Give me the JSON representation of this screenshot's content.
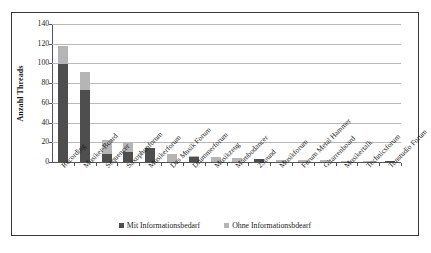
{
  "chart_data": {
    "type": "bar",
    "subtype": "stacked-bar",
    "title": "",
    "xlabel": "",
    "ylabel": "Anzahl Threads",
    "ylim": [
      0,
      140
    ],
    "ytick_values": [
      0,
      20,
      40,
      60,
      80,
      100,
      120,
      140
    ],
    "ytick_labels": [
      "0",
      "20",
      "40",
      "60",
      "80",
      "100",
      "120",
      "140"
    ],
    "grid": true,
    "legend_position": "bottom",
    "categories": [
      "Recording",
      "Musiker-Board",
      "Sequencer",
      "Saxophonforum",
      "Musikerforum",
      "Das Musik Forum",
      "Drummerforum",
      "Musikzeug",
      "Mambodancer",
      "2Sound",
      "Musikforum",
      "Forum Metal Hammer",
      "Gitarrenboard",
      "Musikertalk",
      "Technicsforum",
      "Tonstudio Forum"
    ],
    "series": [
      {
        "name": "Mit Informationsbedarf",
        "color": "#4e4e4e",
        "values": [
          99,
          73,
          8,
          10,
          14,
          0,
          5,
          0,
          0,
          3,
          0,
          0,
          0,
          0,
          0,
          1
        ]
      },
      {
        "name": "Ohne Informationsbdearf",
        "color": "#b5b5b5",
        "values": [
          19,
          18,
          14,
          9,
          0,
          8,
          1,
          5,
          4,
          0,
          2,
          2,
          2,
          1,
          1,
          0
        ]
      }
    ],
    "totals": [
      118,
      91,
      22,
      19,
      14,
      8,
      6,
      5,
      4,
      3,
      2,
      2,
      2,
      1,
      1,
      1
    ]
  },
  "legend": {
    "items": [
      {
        "label": "Mit Informationsbedarf",
        "color": "#4e4e4e"
      },
      {
        "label": "Ohne Informationsbdearf",
        "color": "#b5b5b5"
      }
    ]
  }
}
